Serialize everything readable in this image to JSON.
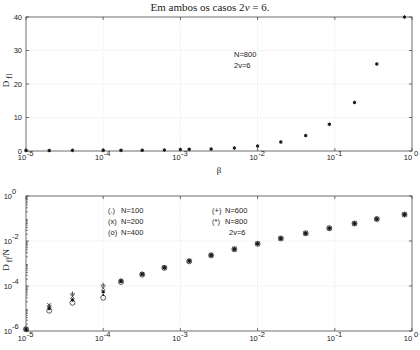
{
  "figure": {
    "title_prefix": "Em ambos os casos 2",
    "title_var": "v",
    "title_suffix": " = 6."
  },
  "chart_data": [
    {
      "id": "top-panel",
      "type": "scatter",
      "title": "",
      "xlabel": "β",
      "ylabel": "D",
      "ylabel_sub": "fl",
      "xscale": "log",
      "yscale": "linear",
      "xlim": [
        1e-05,
        1
      ],
      "ylim": [
        0,
        40
      ],
      "xticks": [
        "10^-5",
        "10^-4",
        "10^-3",
        "10^-2",
        "10^-1",
        "10^0"
      ],
      "xtick_exps": [
        -5,
        -4,
        -3,
        -2,
        -1,
        0
      ],
      "yticks": [
        0,
        10,
        20,
        30,
        40
      ],
      "grid": true,
      "annotations": [
        "N=800",
        "2v=6"
      ],
      "series": [
        {
          "name": "N=800",
          "marker": "star",
          "x": [
            1e-05,
            2e-05,
            4e-05,
            0.0001,
            0.00017,
            0.00032,
            0.00062,
            0.001,
            0.0013,
            0.0025,
            0.005,
            0.01,
            0.02,
            0.042,
            0.085,
            0.18,
            0.35,
            0.8
          ],
          "y": [
            0.15,
            0.15,
            0.2,
            0.2,
            0.2,
            0.25,
            0.3,
            0.45,
            0.5,
            0.6,
            0.9,
            1.5,
            2.7,
            4.6,
            8.0,
            14.5,
            26.0,
            40.0
          ]
        }
      ]
    },
    {
      "id": "bottom-panel",
      "type": "scatter",
      "title": "",
      "xlabel": "",
      "ylabel": "D",
      "ylabel_sub": "fl",
      "ylabel_suffix": "/N",
      "xscale": "log",
      "yscale": "log",
      "xlim": [
        1e-05,
        1
      ],
      "ylim": [
        1e-06,
        1
      ],
      "xticks": [
        "10^-5",
        "10^-4",
        "10^-3",
        "10^-2",
        "10^-1",
        "10^0"
      ],
      "xtick_exps": [
        -5,
        -4,
        -3,
        -2,
        -1,
        0
      ],
      "ytick_exps": [
        0,
        -2,
        -4,
        -6
      ],
      "grid": true,
      "annotations": [
        "2v=6"
      ],
      "legend": [
        {
          "symbol": "(.)",
          "label": "N=100",
          "marker": "dot"
        },
        {
          "symbol": "(x)",
          "label": "N=200",
          "marker": "x"
        },
        {
          "symbol": "(o)",
          "label": "N=400",
          "marker": "circle"
        },
        {
          "symbol": "(+)",
          "label": "N=600",
          "marker": "plus"
        },
        {
          "symbol": "(*)",
          "label": "N=800",
          "marker": "star"
        },
        {
          "symbol": "",
          "label": "2v=6",
          "marker": "none"
        }
      ],
      "x": [
        1e-05,
        2e-05,
        4e-05,
        0.0001,
        0.00017,
        0.00032,
        0.00062,
        0.0013,
        0.0025,
        0.005,
        0.01,
        0.02,
        0.042,
        0.085,
        0.18,
        0.35,
        0.8
      ],
      "series": [
        {
          "name": "N=100",
          "marker": "dot",
          "values": [
            1.2e-06,
            1.1e-05,
            2.6e-05,
            4e-05,
            0.00016,
            0.00033,
            0.00065,
            0.0013,
            0.0023,
            0.0043,
            0.0075,
            0.013,
            0.022,
            0.037,
            0.06,
            0.095,
            0.15
          ]
        },
        {
          "name": "N=200",
          "marker": "x",
          "values": [
            1.2e-06,
            1.4e-05,
            3.4e-05,
            8e-05,
            0.00017,
            0.00034,
            0.00066,
            0.0013,
            0.0024,
            0.0044,
            0.0076,
            0.013,
            0.022,
            0.037,
            0.06,
            0.095,
            0.15
          ]
        },
        {
          "name": "N=400",
          "marker": "circle",
          "values": [
            1.2e-06,
            8e-06,
            1.8e-05,
            3e-05,
            0.00015,
            0.00032,
            0.00064,
            0.00125,
            0.0023,
            0.0043,
            0.0075,
            0.013,
            0.022,
            0.037,
            0.06,
            0.095,
            0.15
          ]
        },
        {
          "name": "N=600",
          "marker": "plus",
          "values": [
            1.2e-06,
            1.3e-05,
            4.5e-05,
            0.00011,
            0.00018,
            0.00035,
            0.00067,
            0.0013,
            0.0024,
            0.0044,
            0.0076,
            0.013,
            0.022,
            0.037,
            0.06,
            0.095,
            0.15
          ]
        },
        {
          "name": "N=800",
          "marker": "star",
          "values": [
            1.2e-06,
            1e-05,
            2.4e-05,
            5.5e-05,
            0.00016,
            0.00033,
            0.00065,
            0.0013,
            0.0023,
            0.0043,
            0.0075,
            0.013,
            0.022,
            0.037,
            0.06,
            0.095,
            0.15
          ]
        }
      ]
    }
  ]
}
